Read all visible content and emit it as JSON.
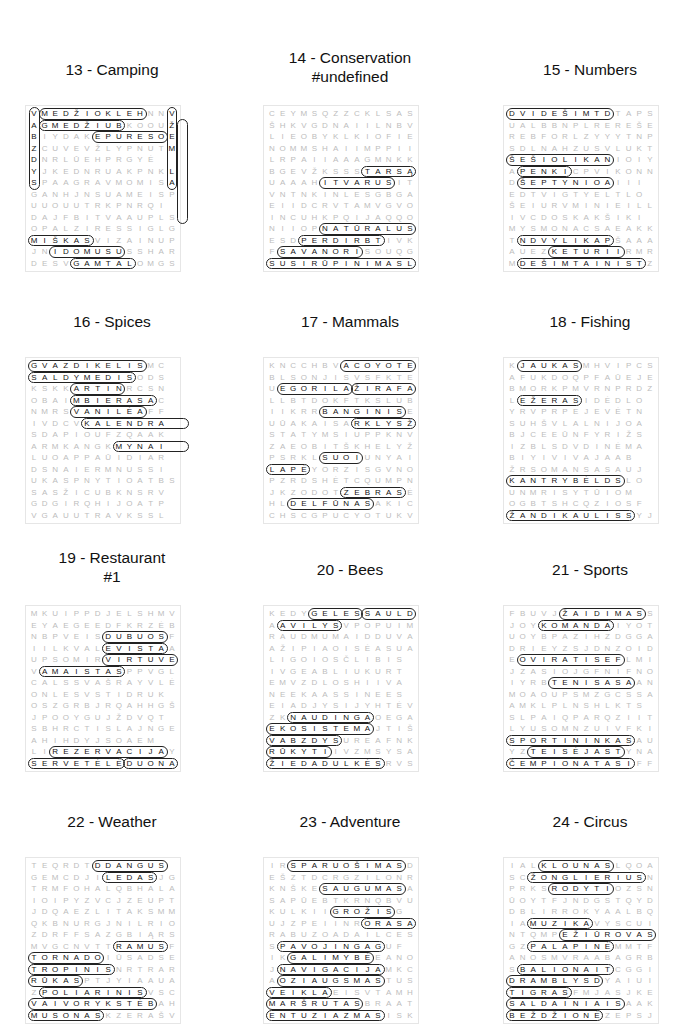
{
  "puzzles": [
    {
      "title": "13 - Camping",
      "x": 12,
      "y": 60,
      "rows": [
        "VMEDŽIOKLEHNNV",
        "AGMEDŽIUBKOOUŽ",
        "BIYDAKEPURESOE",
        "ZCUVEVŽLYPNUTM",
        "DNRLŪEHPRGYĖ",
        "YJKEDNRUAKPNKL",
        "SPAAGRAVMOMISA",
        "GANHJNSUAMEISP",
        "UUOUUTRKPNRQI",
        "DAJFBITVAAUPLS",
        "OPALZIRESSIGLG",
        "MIŠKASVIZAIN UP",
        "JNIDOMUSUSSHAR",
        "DESVGAMTALOMGS"
      ],
      "words": [
        [
          0,
          1,
          0,
          10
        ],
        [
          1,
          1,
          1,
          8
        ],
        [
          2,
          6,
          2,
          12
        ],
        [
          0,
          0,
          6,
          0
        ],
        [
          0,
          13,
          6,
          13
        ],
        [
          1,
          14,
          9,
          14
        ],
        [
          11,
          0,
          11,
          5
        ],
        [
          12,
          2,
          12,
          8
        ],
        [
          13,
          4,
          13,
          9
        ]
      ]
    },
    {
      "title": "14 - Conservation",
      "x": 250,
      "y": 60,
      "rows": [
        "CEYMSQZZCKLSAS",
        "ŠHKVGDNAIILNBV",
        "LIEOBYKLKIOFIE",
        "NOMMSHAIIMPPII",
        "LRPAIIAAAGMNKK",
        "BGEVŽKSSSTARSĄ",
        "UAAAHITVARUSIT",
        "VNTNKINLESGBGA",
        "EIIDCRVTAMVGVO",
        "INCUHKPQIJAQQO",
        "NIIOPNATŪRALUS",
        "ESDPERDIRBTIVK",
        "FSAVANORISOUQG",
        "SUSIRŪPINIMASL"
      ],
      "words": [
        [
          10,
          5,
          10,
          13
        ],
        [
          11,
          3,
          11,
          10
        ],
        [
          12,
          1,
          12,
          8
        ],
        [
          13,
          0,
          13,
          13
        ],
        [
          5,
          9,
          5,
          13
        ],
        [
          6,
          5,
          6,
          11
        ]
      ]
    },
    {
      "title": "15 - Numbers",
      "x": 490,
      "y": 60,
      "rows": [
        "DVIDEŠIMTDTAPS",
        "UALBBNPLREREŠE",
        "REBFORLZYYYTNP",
        "SDLNAHZUSVLUKT",
        "ŠEŠIOLIKANIOIY",
        "APENKICPVIKONN",
        "DŠEPTYNIOAIII",
        "EDTVIGTYELTLO",
        "ŠEIURVMINIEILL",
        "IVCDOSKAKŠIKI",
        "MYSMONACSAEAKK",
        "TNDVYLIKAPŠAAA",
        "AUEZKETURIIRMR",
        "MDEŠIMTAINISTZ"
      ],
      "words": [
        [
          0,
          0,
          0,
          9
        ],
        [
          4,
          0,
          4,
          9
        ],
        [
          5,
          1,
          5,
          5
        ],
        [
          6,
          1,
          6,
          9
        ],
        [
          11,
          1,
          11,
          9
        ],
        [
          12,
          4,
          12,
          10
        ],
        [
          13,
          1,
          13,
          12
        ]
      ]
    },
    {
      "title": "16 - Spices",
      "x": 12,
      "y": 312,
      "rows": [
        "GVAZDIKELISMC",
        "SALDYMEDISODS",
        "KSKKARTINRCSN",
        "OBAIMBIERASAC",
        "NMRSVANILĖAFF",
        "IVDCVKALENDRA",
        "SDAPIOUFZQAAK",
        "ARMKANGKMYNAI",
        "LUOAPPAŪIDIAR",
        "DSNAIERMNUSSI",
        "UKASPNYTIOATBS",
        "SASŽICUBKNSRV",
        "GDGIRQHIJOATP",
        "VGAUUTRAVKSSL"
      ],
      "words": [
        [
          0,
          0,
          0,
          10
        ],
        [
          1,
          0,
          1,
          9
        ],
        [
          2,
          4,
          2,
          8
        ],
        [
          3,
          4,
          3,
          11
        ],
        [
          4,
          4,
          4,
          10
        ],
        [
          5,
          5,
          5,
          14
        ],
        [
          7,
          8,
          7,
          14
        ]
      ]
    },
    {
      "title": "17 - Mammals",
      "x": 250,
      "y": 312,
      "rows": [
        "KNCCHBVACOYOTE",
        "BLSONJISVSFKTE",
        "UEGORILAŽIRAFA",
        "LLBTDOKFTKSLUB",
        "IIKRRBANGINISE",
        "UŪAKAISARKLYSŽ",
        "STATYMSIUPPKNVD",
        "ZAEOBITŠKHELYŽ",
        "PSRKLSUOIUNYAI",
        "LAPĖYORZISGVNO",
        "PZRDSHĖTCQUMPN",
        "JKZODOTZEBRASĖ",
        "HLDELFŪNASAKIC",
        "CHSCGPUCYOTUKV"
      ],
      "words": [
        [
          0,
          7,
          0,
          13
        ],
        [
          2,
          1,
          2,
          7
        ],
        [
          2,
          8,
          2,
          13
        ],
        [
          4,
          5,
          4,
          12
        ],
        [
          5,
          8,
          5,
          13
        ],
        [
          8,
          5,
          8,
          8
        ],
        [
          9,
          0,
          9,
          3
        ],
        [
          11,
          7,
          11,
          12
        ],
        [
          12,
          2,
          12,
          9
        ]
      ]
    },
    {
      "title": "18 - Fishing",
      "x": 490,
      "y": 312,
      "rows": [
        "KJAUKASMHVIPCS",
        "AFUKDOQPFAŪEJE",
        "BMORKPMVRNPRDZ",
        "LEŽERASIDĖDLO",
        "YRVPRPEJEVĖTN",
        "SUHŠVLALNIJOA",
        "BJCEEŪNFYRIŽS",
        "IZBLSDVDINĖMA",
        "BIYIVIVAJAAB",
        "ŽRSOMANSASAUJ",
        "KANTRYBĖLDSLO",
        "UNMRISYTŪIOM",
        "OGBTSHCQZIOSF",
        "ŽANDIKAULISSYJ"
      ],
      "words": [
        [
          0,
          1,
          0,
          6
        ],
        [
          3,
          1,
          3,
          6
        ],
        [
          10,
          0,
          10,
          10
        ],
        [
          13,
          0,
          13,
          11
        ]
      ]
    },
    {
      "title": "19 - Restaurant #1",
      "x": 12,
      "y": 560,
      "rows": [
        "MKUIPPDJELSHMV",
        "EYAEGEEDFKRZĖB",
        "NBPVEISDUBUOSF",
        "IILKVALEVISTAA",
        "UPSOMIRVIRTUVE",
        "VAMAISTASPPVGL",
        "CALSSVAŠRAYVLĖ",
        "ONLESVSTIDRUK",
        "OSZGRBJRQAHHGŠ",
        "JPOOYGUJŽDVQT",
        "SBHRCTISLAJNGE",
        "AHIHDYJSOAEM",
        "LIREZERVACIJAY",
        "SERVETĖLĖDUONA"
      ],
      "words": [
        [
          2,
          7,
          2,
          12
        ],
        [
          3,
          7,
          3,
          12
        ],
        [
          4,
          7,
          4,
          13
        ],
        [
          5,
          1,
          5,
          8
        ],
        [
          12,
          2,
          12,
          12
        ],
        [
          13,
          0,
          13,
          8
        ],
        [
          13,
          9,
          13,
          13
        ]
      ]
    },
    {
      "title": "20 - Bees",
      "x": 250,
      "y": 560,
      "rows": [
        "KEDYGELESSAULD",
        "AAVILYSVPOPUIM",
        "RAUDMUMAIDDUVA",
        "AŽIPIAOISĖASUAI",
        "LIGOIOSČLIBIS",
        "IVGEABLIUKURT",
        "EMVZDLOSHIIVA",
        "NEEKAASSINEES",
        "EIADJYSIJYHTĖV",
        "ZKNAUDINGAOEGA",
        "EKOSISTEMAJTIŠ",
        "VABZDYSUREAFNK",
        "RŪKYTIIVZMSYSA",
        "ŽIEDADULKĖSRVS"
      ],
      "words": [
        [
          0,
          4,
          0,
          8
        ],
        [
          0,
          9,
          0,
          13
        ],
        [
          1,
          1,
          1,
          6
        ],
        [
          9,
          2,
          9,
          9
        ],
        [
          10,
          0,
          10,
          9
        ],
        [
          11,
          0,
          11,
          6
        ],
        [
          12,
          0,
          12,
          5
        ],
        [
          13,
          0,
          13,
          10
        ]
      ]
    },
    {
      "title": "21 - Sports",
      "x": 490,
      "y": 560,
      "rows": [
        "FBUVJŽAIDIMASS",
        "JOYKOMANDAIYOT",
        "UOYBPAZIHZDGGA",
        "DRIEYZSJDNZOID",
        "EOVIRATISEFLMI",
        "JZASIOJGFNIFNO",
        "IYRBTENISASAAN",
        "MOAOUPSMZGCSSA",
        "AMKLPLNSHLKTS",
        "SLPAIQPARQZIIT",
        "LYUSOMNZUIVFKI",
        "SPORTININKASAU",
        "YZTEISĖJASTYNA",
        "ČEMPIONATASIFF"
      ],
      "words": [
        [
          0,
          5,
          0,
          12
        ],
        [
          1,
          3,
          1,
          9
        ],
        [
          4,
          1,
          4,
          10
        ],
        [
          6,
          4,
          6,
          11
        ],
        [
          11,
          0,
          11,
          11
        ],
        [
          12,
          2,
          12,
          10
        ],
        [
          13,
          0,
          13,
          11
        ]
      ]
    },
    {
      "title": "22 - Weather",
      "x": 12,
      "y": 812,
      "rows": [
        "TEQRDTDDANGUS",
        "GEMCDJILEDASJG",
        "TRMFOHALQBHALA",
        "IOIPYZVCJZEUPT",
        "JDQAEZLITAKSMM",
        "QKBNURGJNILRIO",
        "ZDRFFSAZGBIĄRS",
        "MVGCNVTTRAMUSF",
        "TORNADOIŪSADSE",
        "TROPINISNRTRAR",
        "RŪKASPTJYIAAUA",
        "ZPOLIARINISVSC",
        "VAIVORYKSTĖBAH",
        "MUSONASKZERAŠV"
      ],
      "words": [
        [
          0,
          6,
          0,
          12
        ],
        [
          1,
          7,
          1,
          11
        ],
        [
          7,
          8,
          7,
          12
        ],
        [
          8,
          0,
          8,
          6
        ],
        [
          9,
          0,
          9,
          7
        ],
        [
          10,
          0,
          10,
          4
        ],
        [
          11,
          1,
          11,
          10
        ],
        [
          12,
          0,
          12,
          11
        ],
        [
          13,
          0,
          13,
          6
        ]
      ]
    },
    {
      "title": "23 - Adventure",
      "x": 250,
      "y": 812,
      "rows": [
        "IRSPARUOŠIMASD",
        "EŠZTDCRGZILONR",
        "KNŠKESAUGUMASA",
        "SAPŪEBTKRNQBVU",
        "KULKIIGROŽISG",
        "UJZPEIINRORASA",
        "RABUZOADAILCESĮ",
        "SPAVOJINGAGUF",
        "IKGALIMYBĖEANO",
        "JNAVIGACIJAMKC",
        "AOZIAUGSMASTUS",
        "VEIKLAEISVTAMH",
        "MARŠRUTASBRAAT",
        "ENTUZIAZMASISK"
      ],
      "words": [
        [
          0,
          2,
          0,
          12
        ],
        [
          2,
          5,
          2,
          12
        ],
        [
          4,
          6,
          4,
          11
        ],
        [
          5,
          9,
          5,
          13
        ],
        [
          7,
          1,
          7,
          10
        ],
        [
          8,
          2,
          8,
          9
        ],
        [
          9,
          1,
          9,
          10
        ],
        [
          10,
          1,
          10,
          10
        ],
        [
          11,
          0,
          11,
          5
        ],
        [
          12,
          0,
          12,
          8
        ],
        [
          13,
          0,
          13,
          10
        ]
      ]
    },
    {
      "title": "24 - Circus",
      "x": 490,
      "y": 812,
      "rows": [
        "IALKLOUNASLQOA",
        "SCŽONGLIERIUSN",
        "PRKSRODYTIOZSN",
        "ŪOYTFJNDGSTQYD",
        "DBLIRROKYAALBQ",
        "IAMUZIKAVYSCUI",
        "NTQMPEŽIŪROVAS",
        "GZPALAPINĖMMTF",
        "ANOSMVRAABAGRB",
        "SBALIONAITCGGIN",
        "DRAMBLYSDYAIUI",
        "TIGRASFMJASJKE",
        "SALDAINIAISAAK",
        "BEŽDŽIONĖZEPSJ"
      ],
      "words": [
        [
          0,
          3,
          0,
          9
        ],
        [
          1,
          2,
          1,
          12
        ],
        [
          2,
          4,
          2,
          9
        ],
        [
          5,
          2,
          5,
          7
        ],
        [
          6,
          5,
          6,
          13
        ],
        [
          7,
          2,
          7,
          9
        ],
        [
          9,
          1,
          9,
          9
        ],
        [
          10,
          0,
          10,
          8
        ],
        [
          11,
          0,
          11,
          5
        ],
        [
          12,
          0,
          12,
          10
        ],
        [
          13,
          0,
          13,
          8
        ]
      ]
    }
  ]
}
